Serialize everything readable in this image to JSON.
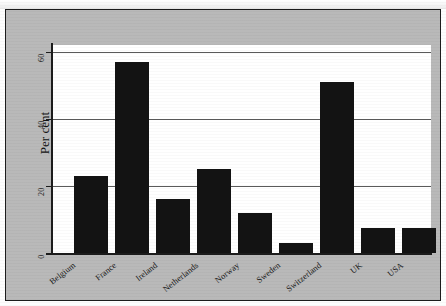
{
  "chart_data": {
    "type": "bar",
    "title": "",
    "subtitle": "",
    "xlabel": "",
    "ylabel": "Per cent",
    "categories": [
      "Belgium",
      "France",
      "Ireland",
      "Netherlands",
      "Norway",
      "Sweden",
      "Switzerland",
      "UK",
      "USA"
    ],
    "values": [
      23,
      57,
      16,
      25,
      12,
      3,
      51,
      7.5,
      7.5
    ],
    "ylim": [
      0,
      62
    ],
    "yticks": [
      0,
      20,
      40,
      60
    ],
    "ytick_labels": [
      "0",
      "20",
      "40",
      "60"
    ],
    "grid": true,
    "grid_axis": "y",
    "legend": null,
    "bar_color": "#131313",
    "plot_background": "#ffffff",
    "figure_background": "#b9b9b9",
    "frame_color": "#1c1c1c"
  },
  "axis": {
    "y_label": "Per cent"
  }
}
